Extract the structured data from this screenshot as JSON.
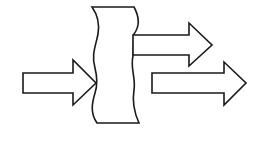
{
  "diagram": {
    "type": "flow-split",
    "background": "#ffffff",
    "stroke_color": "#1a1a1a",
    "elements": [
      {
        "id": "input-arrow",
        "kind": "block-arrow",
        "direction": "right",
        "count": 1
      },
      {
        "id": "barrier",
        "kind": "wavy-block"
      },
      {
        "id": "output-arrow-top",
        "kind": "block-arrow",
        "direction": "right"
      },
      {
        "id": "output-arrow-bottom",
        "kind": "block-arrow",
        "direction": "right"
      }
    ]
  }
}
